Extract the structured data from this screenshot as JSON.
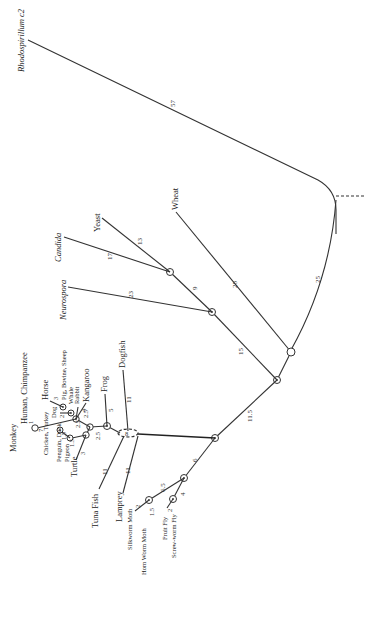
{
  "outgroup": {
    "label": "Rhodospirillum c2",
    "branch": "57"
  },
  "root": {
    "connector_to": "25"
  },
  "plants": {
    "label": "Wheat",
    "branch": "28"
  },
  "fungi": {
    "stem": "15",
    "neurospora": {
      "label": "Neurospora",
      "branch": "23"
    },
    "yeast_candida_stem": "9",
    "candida": {
      "label": "Candida",
      "branch": "17"
    },
    "yeast": {
      "label": "Yeast",
      "branch": "13"
    }
  },
  "animals": {
    "stem": "11.5",
    "insects": {
      "stem": "6",
      "moth_stem": "6.5",
      "fly_stem": "4",
      "silkworm": {
        "label": "Silkworm Moth",
        "branch": "2"
      },
      "hornworm": {
        "label": "Horn Worm Moth",
        "branch": "1.5"
      },
      "fruitfly": {
        "label": "Fruit Fly",
        "branch": "2"
      },
      "screwworm": {
        "label": "Screw-worm Fly",
        "branch": ""
      }
    },
    "vertebrates": {
      "dogfish": {
        "label": "Dogfish",
        "branch": "11"
      },
      "tuna": {
        "label": "Tuna Fish",
        "branch": "11"
      },
      "lamprey": {
        "label": "Lamprey",
        "branch": "11"
      },
      "frog": {
        "label": "Frog",
        "branch": "5"
      },
      "tetrapod_stem": "2.5",
      "amniote_stem": "2.5",
      "turtle": {
        "label": "Turtle",
        "branch": "3"
      },
      "bird_stem": "2.5",
      "chicken": {
        "label": "Chicken, Turkey",
        "branch": ""
      },
      "penguin": {
        "label": "Penguin, Duck",
        "branch": "1.5"
      },
      "pigeon": {
        "label": "Pigeon",
        "branch": "1.5"
      },
      "mammal_stem": "2.5",
      "kangaroo": {
        "label": "Kangaroo",
        "branch": "4"
      },
      "rabbit": {
        "label": "Rabbit",
        "branch": ""
      },
      "whale": {
        "label": "Whale",
        "branch": ""
      },
      "pig": {
        "label": "Pig, Bovine, Sheep",
        "branch": ""
      },
      "horse": {
        "label": "Horse",
        "branch": "3"
      },
      "dog": {
        "label": "Dog",
        "branch": "2"
      },
      "primate_stem": "7",
      "human": {
        "label": "Human, Chimpanzee",
        "branch": ""
      },
      "monkey": {
        "label": "Monkey",
        "branch": "1"
      }
    }
  }
}
